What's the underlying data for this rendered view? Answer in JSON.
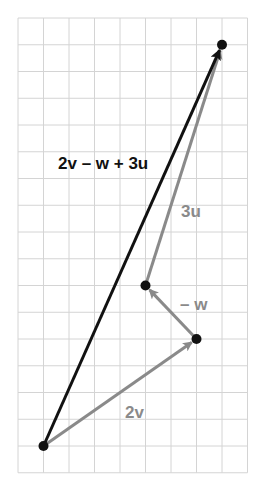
{
  "diagram": {
    "type": "vector-addition",
    "grid": {
      "columns": 9,
      "rows": 17,
      "origin_px": [
        18,
        18
      ],
      "cell_w": 25.5,
      "cell_h": 26.75,
      "line_color": "#d4d4d4"
    },
    "points": [
      {
        "name": "start",
        "col": 1,
        "row": 16
      },
      {
        "name": "after-2v",
        "col": 7,
        "row": 12
      },
      {
        "name": "after-minus-w",
        "col": 5,
        "row": 10
      },
      {
        "name": "end",
        "col": 8,
        "row": 1
      }
    ],
    "vectors": [
      {
        "id": "2v",
        "label": "2v",
        "from": 0,
        "to": 1,
        "color": "#8a8a8a",
        "label_pos": [
          125,
          418
        ]
      },
      {
        "id": "minus-w",
        "label": "– w",
        "from": 1,
        "to": 2,
        "color": "#8a8a8a",
        "label_pos": [
          180,
          310
        ]
      },
      {
        "id": "3u",
        "label": "3u",
        "from": 2,
        "to": 3,
        "color": "#8a8a8a",
        "label_pos": [
          181,
          217
        ]
      },
      {
        "id": "resultant",
        "label": "2v – w + 3u",
        "from": 0,
        "to": 3,
        "color": "#111111",
        "label_pos": [
          58,
          169
        ]
      }
    ],
    "labels": {
      "v2": "2v",
      "minus_w": "– w",
      "u3": "3u",
      "resultant": "2v – w + 3u"
    },
    "colors": {
      "resultant": "#111111",
      "components": "#8a8a8a",
      "points": "#111111"
    }
  }
}
